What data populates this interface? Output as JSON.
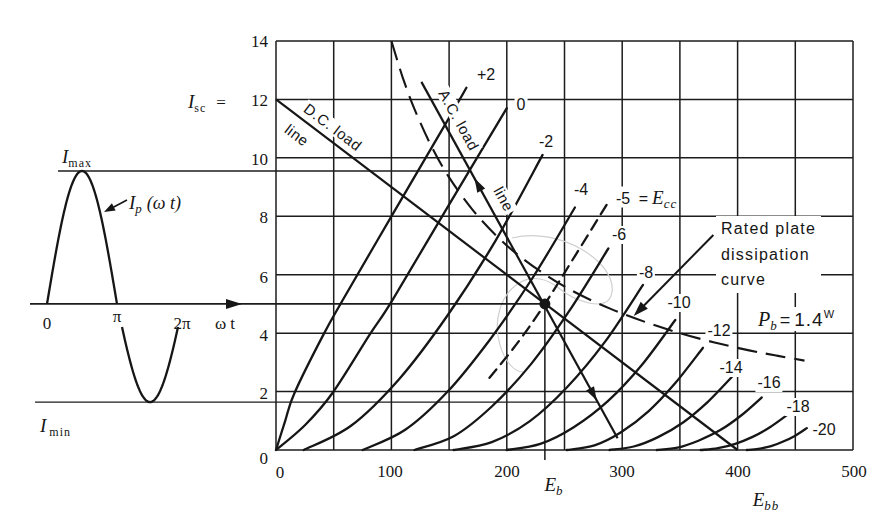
{
  "labels": {
    "y_ticks": [
      "14",
      "12",
      "10",
      "8",
      "6",
      "4",
      "2",
      "0"
    ],
    "x_ticks": [
      "0",
      "100",
      "200",
      "300",
      "400",
      "500"
    ],
    "isc": {
      "symbol": "I",
      "sub": "sc",
      "eq": "="
    },
    "eb": {
      "symbol": "E",
      "sub": "b"
    },
    "ebb": {
      "symbol": "E",
      "sub": "bb"
    },
    "grid_voltages": [
      "+2",
      "0",
      "-2",
      "-4",
      "-5",
      "-6",
      "-8",
      "-10",
      "-12",
      "-14",
      "-16",
      "-18",
      "-20"
    ],
    "ecc": {
      "eq": "=",
      "symbol": "E",
      "sub": "cc"
    },
    "dc_load": [
      "D.C. load",
      "line"
    ],
    "ac_load": [
      "A.C. load",
      "line"
    ],
    "dissipation": [
      "Rated plate",
      "dissipation",
      "curve"
    ],
    "pb": {
      "symbol": "P",
      "sub": "b",
      "eq": "=",
      "value": "1.4",
      "unit": "W"
    },
    "waveform": {
      "imax_symbol": "I",
      "imax_sub": "max",
      "imin_symbol": "I",
      "imin_sub": "min",
      "ip_symbol": "I",
      "ip_sub": "p",
      "ip_arg": "(ω t)",
      "tick_0": "0",
      "tick_pi": "π",
      "tick_2pi": "2π",
      "axis_label": "ω t"
    }
  },
  "chart_data": [
    {
      "type": "line",
      "title": "",
      "xlabel": "",
      "ylabel": "",
      "xlim": [
        0,
        500
      ],
      "ylim": [
        0,
        14
      ],
      "x_ticks": [
        0,
        100,
        200,
        300,
        400,
        500
      ],
      "y_ticks": [
        0,
        2,
        4,
        6,
        8,
        10,
        12,
        14
      ],
      "grid": true,
      "grid_step": [
        50,
        2
      ],
      "series": [
        {
          "name": "+2",
          "style": "solid",
          "points": [
            [
              0,
              0
            ],
            [
              8,
              1.0
            ],
            [
              16,
              1.95
            ],
            [
              41,
              3.94
            ],
            [
              58,
              5.14
            ],
            [
              100,
              8.0
            ],
            [
              146,
              11.1
            ],
            [
              165,
              12.4
            ]
          ]
        },
        {
          "name": "0",
          "style": "solid",
          "points": [
            [
              0,
              0
            ],
            [
              25,
              0.85
            ],
            [
              49,
              1.95
            ],
            [
              81,
              3.94
            ],
            [
              101,
              5.14
            ],
            [
              150,
              8.4
            ],
            [
              200,
              11.7
            ]
          ]
        },
        {
          "name": "-2",
          "style": "solid",
          "points": [
            [
              24,
              0
            ],
            [
              65,
              0.83
            ],
            [
              107,
              2.44
            ],
            [
              148,
              4.57
            ],
            [
              190,
              7.15
            ],
            [
              231,
              10.1
            ]
          ]
        },
        {
          "name": "-4",
          "style": "solid",
          "points": [
            [
              75,
              0
            ],
            [
              112,
              0.69
            ],
            [
              149,
              2.01
            ],
            [
              185,
              3.76
            ],
            [
              222,
              5.87
            ],
            [
              259,
              8.3
            ]
          ]
        },
        {
          "name": "-5",
          "style": "dashed",
          "points": [
            [
              185,
              2.47
            ],
            [
              210,
              3.7
            ],
            [
              233,
              5.0
            ],
            [
              260,
              6.7
            ],
            [
              289,
              8.55
            ]
          ]
        },
        {
          "name": "-6",
          "style": "solid",
          "points": [
            [
              120,
              0
            ],
            [
              154,
              0.47
            ],
            [
              187,
              1.49
            ],
            [
              221,
              2.94
            ],
            [
              254,
              4.75
            ],
            [
              288,
              6.9
            ]
          ]
        },
        {
          "name": "-8",
          "style": "solid",
          "points": [
            [
              154,
              0
            ],
            [
              187,
              0.27
            ],
            [
              220,
              0.99
            ],
            [
              252,
              2.14
            ],
            [
              285,
              3.7
            ],
            [
              318,
              5.65
            ]
          ]
        },
        {
          "name": "-10",
          "style": "solid",
          "points": [
            [
              200,
              0
            ],
            [
              229,
              0.21
            ],
            [
              258,
              0.78
            ],
            [
              288,
              1.69
            ],
            [
              317,
              2.91
            ],
            [
              346,
              4.45
            ]
          ]
        },
        {
          "name": "-12",
          "style": "solid",
          "points": [
            [
              252,
              0
            ],
            [
              276,
              0.16
            ],
            [
              299,
              0.61
            ],
            [
              323,
              1.33
            ],
            [
              346,
              2.29
            ],
            [
              370,
              3.5
            ]
          ]
        },
        {
          "name": "-14",
          "style": "solid",
          "points": [
            [
              289,
              0
            ],
            [
              310,
              0.12
            ],
            [
              331,
              0.44
            ],
            [
              353,
              0.95
            ],
            [
              374,
              1.64
            ],
            [
              395,
              2.5
            ]
          ]
        },
        {
          "name": "-16",
          "style": "solid",
          "points": [
            [
              330,
              0
            ],
            [
              348,
              0.08
            ],
            [
              366,
              0.32
            ],
            [
              385,
              0.68
            ],
            [
              403,
              1.18
            ],
            [
              421,
              1.8
            ]
          ]
        },
        {
          "name": "-18",
          "style": "solid",
          "points": [
            [
              368,
              0
            ],
            [
              383,
              0.06
            ],
            [
              398,
              0.21
            ],
            [
              413,
              0.45
            ],
            [
              428,
              0.78
            ],
            [
              443,
              1.2
            ]
          ]
        },
        {
          "name": "-20",
          "style": "solid",
          "points": [
            [
              408,
              0
            ],
            [
              418,
              0.04
            ],
            [
              429,
              0.13
            ],
            [
              439,
              0.28
            ],
            [
              450,
              0.49
            ],
            [
              460,
              0.75
            ]
          ]
        }
      ],
      "dc_load_line": {
        "label": "D.C. load line",
        "points": [
          [
            0,
            12
          ],
          [
            400,
            0
          ]
        ],
        "I_sc": 12,
        "E_bb": 400
      },
      "ac_load_line": {
        "label": "A.C. load line",
        "points": [
          [
            126,
            12.6
          ],
          [
            296,
            0.4
          ]
        ],
        "arrows": [
          {
            "V": 172,
            "dir": "up"
          },
          {
            "V": 278,
            "dir": "down"
          }
        ]
      },
      "dissipation_curve": {
        "label": "Rated plate dissipation curve",
        "P_b_watts": 1.4,
        "style": "dashed",
        "points": [
          [
            100,
            14
          ],
          [
            110,
            12.73
          ],
          [
            120,
            11.67
          ],
          [
            135,
            10.37
          ],
          [
            150,
            9.33
          ],
          [
            170,
            8.24
          ],
          [
            190,
            7.37
          ],
          [
            210,
            6.67
          ],
          [
            235,
            5.96
          ],
          [
            260,
            5.38
          ],
          [
            290,
            4.83
          ],
          [
            320,
            4.38
          ],
          [
            350,
            4.0
          ],
          [
            380,
            3.68
          ],
          [
            410,
            3.41
          ],
          [
            435,
            3.22
          ],
          [
            458,
            3.06
          ]
        ],
        "arrow_from": [
          379,
          7.36
        ],
        "arrow_to": [
          310,
          4.59
        ]
      },
      "operating_point": {
        "E_b": 233,
        "I_b": 5.0,
        "E_cc": -5
      },
      "I_max": 9.55,
      "I_min": 1.64
    },
    {
      "type": "line",
      "title": "",
      "xlabel": "ω t",
      "ylabel": "I_p(ω t)",
      "x_ticks": [
        "0",
        "π",
        "2π"
      ],
      "I_max": 9.55,
      "I_min": 1.64,
      "I_dc": 5.0
    }
  ]
}
